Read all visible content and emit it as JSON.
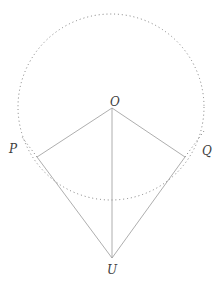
{
  "figure": {
    "type": "geometry-diagram",
    "labels": {
      "center": "O",
      "left": "P",
      "right": "Q",
      "external": "U"
    },
    "colors": {
      "background": "#ffffff",
      "solid_line": "#999999",
      "dotted_line": "#7d7d7d",
      "label_text": "#3d3d3d"
    }
  }
}
